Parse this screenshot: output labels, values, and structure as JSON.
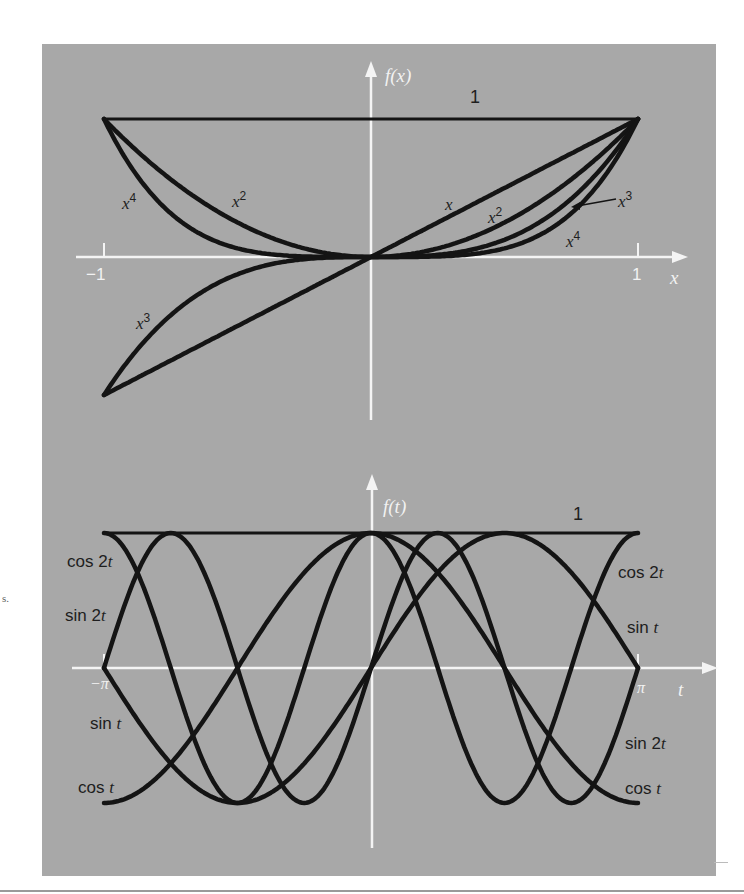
{
  "chart_data": [
    {
      "type": "line",
      "title": "",
      "xlabel": "x",
      "ylabel": "f(x)",
      "xlim": [
        -1,
        1
      ],
      "ylim": [
        -1,
        1
      ],
      "grid": false,
      "x_ticks": [
        "-1",
        "1"
      ],
      "series": [
        {
          "name": "1",
          "expr": "1"
        },
        {
          "name": "x",
          "expr": "x"
        },
        {
          "name": "x^2",
          "expr": "x^2"
        },
        {
          "name": "x^3",
          "expr": "x^3"
        },
        {
          "name": "x^4",
          "expr": "x^4"
        }
      ],
      "x": [
        -1,
        -0.5,
        0,
        0.5,
        1
      ],
      "values": {
        "1": [
          1,
          1,
          1,
          1,
          1
        ],
        "x": [
          -1,
          -0.5,
          0,
          0.5,
          1
        ],
        "x^2": [
          1,
          0.25,
          0,
          0.25,
          1
        ],
        "x^3": [
          -1,
          -0.125,
          0,
          0.125,
          1
        ],
        "x^4": [
          1,
          0.0625,
          0,
          0.0625,
          1
        ]
      }
    },
    {
      "type": "line",
      "title": "",
      "xlabel": "t",
      "ylabel": "f(t)",
      "xlim": [
        "-π",
        "π"
      ],
      "ylim": [
        -1,
        1
      ],
      "grid": false,
      "x_ticks": [
        "-π",
        "π"
      ],
      "series": [
        {
          "name": "1",
          "expr": "1"
        },
        {
          "name": "cos t",
          "expr": "cos(t)"
        },
        {
          "name": "sin t",
          "expr": "sin(t)"
        },
        {
          "name": "cos 2t",
          "expr": "cos(2t)"
        },
        {
          "name": "sin 2t",
          "expr": "sin(2t)"
        }
      ],
      "x": [
        "-π",
        "-π/2",
        "0",
        "π/2",
        "π"
      ],
      "values": {
        "1": [
          1,
          1,
          1,
          1,
          1
        ],
        "cos t": [
          -1,
          0,
          1,
          0,
          -1
        ],
        "sin t": [
          0,
          -1,
          0,
          1,
          0
        ],
        "cos 2t": [
          1,
          -1,
          1,
          -1,
          1
        ],
        "sin 2t": [
          0,
          0,
          0,
          0,
          0
        ]
      }
    }
  ],
  "top_plot": {
    "y_axis_label": "f(x)",
    "x_axis_label": "x",
    "tick_neg": "−1",
    "tick_pos": "1",
    "line_one_label": "1",
    "labels": {
      "x4_left": "x",
      "x4_left_exp": "4",
      "x2_left": "x",
      "x2_left_exp": "2",
      "x_right": "x",
      "x2_right": "x",
      "x2_right_exp": "2",
      "x3_right": "x",
      "x3_right_exp": "3",
      "x4_right": "x",
      "x4_right_exp": "4",
      "x3_left": "x",
      "x3_left_exp": "3"
    }
  },
  "bottom_plot": {
    "y_axis_label": "f(t)",
    "x_axis_label": "t",
    "tick_neg": "−π",
    "tick_pos": "π",
    "line_one_label": "1",
    "labels_left": {
      "cos2t_pre": "cos 2",
      "cos2t_var": "t",
      "sin2t_pre": "sin 2",
      "sin2t_var": "t",
      "sint_pre": "sin ",
      "sint_var": "t",
      "cost_pre": "cos ",
      "cost_var": "t"
    },
    "labels_right": {
      "cos2t_pre": "cos 2",
      "cos2t_var": "t",
      "sint_pre": "sin ",
      "sint_var": "t",
      "sin2t_pre": "sin 2",
      "sin2t_var": "t",
      "cost_pre": "cos ",
      "cost_var": "t"
    }
  },
  "margin_fragment": "s.",
  "colors": {
    "panel": "#a8a8a8",
    "curve": "#141414",
    "axis": "#f4f4f4",
    "page": "#ffffff"
  }
}
